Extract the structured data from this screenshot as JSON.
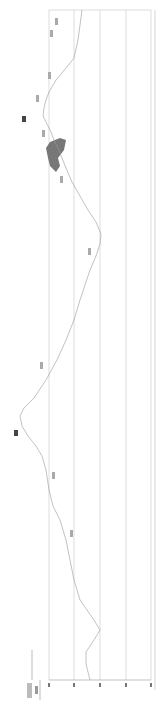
{
  "chart_data": {
    "type": "line",
    "orientation": "rotated-90",
    "title": "",
    "xlabel": "",
    "ylabel": "m",
    "grid": true,
    "plot_box": {
      "left": 49,
      "right": 151,
      "top": 10,
      "bottom": 680
    },
    "gridlines_x": [
      49,
      74,
      100,
      126,
      151
    ],
    "tick_labels": [
      "",
      "",
      "",
      "",
      ""
    ],
    "curve_points": [
      [
        82,
        10
      ],
      [
        78,
        40
      ],
      [
        74,
        58
      ],
      [
        66,
        68
      ],
      [
        56,
        80
      ],
      [
        49,
        92
      ],
      [
        46,
        100
      ],
      [
        44,
        108
      ],
      [
        43,
        116
      ],
      [
        47,
        124
      ],
      [
        51,
        132
      ],
      [
        54,
        140
      ],
      [
        58,
        148
      ],
      [
        62,
        158
      ],
      [
        66,
        168
      ],
      [
        72,
        182
      ],
      [
        80,
        196
      ],
      [
        88,
        210
      ],
      [
        96,
        222
      ],
      [
        101,
        234
      ],
      [
        100,
        244
      ],
      [
        96,
        256
      ],
      [
        90,
        270
      ],
      [
        84,
        288
      ],
      [
        80,
        300
      ],
      [
        74,
        320
      ],
      [
        66,
        340
      ],
      [
        58,
        358
      ],
      [
        46,
        380
      ],
      [
        34,
        398
      ],
      [
        24,
        408
      ],
      [
        20,
        416
      ],
      [
        22,
        426
      ],
      [
        28,
        436
      ],
      [
        36,
        446
      ],
      [
        42,
        456
      ],
      [
        46,
        470
      ],
      [
        49,
        490
      ],
      [
        53,
        506
      ],
      [
        60,
        520
      ],
      [
        66,
        540
      ],
      [
        70,
        560
      ],
      [
        74,
        580
      ],
      [
        80,
        600
      ],
      [
        94,
        620
      ],
      [
        100,
        630
      ],
      [
        94,
        640
      ],
      [
        86,
        652
      ],
      [
        86,
        664
      ],
      [
        90,
        680
      ]
    ],
    "annotations": [
      {
        "x": 55,
        "y": 18,
        "text": "",
        "bold": false
      },
      {
        "x": 50,
        "y": 30,
        "text": "",
        "bold": false
      },
      {
        "x": 48,
        "y": 72,
        "text": "",
        "bold": false
      },
      {
        "x": 36,
        "y": 95,
        "text": "",
        "bold": false
      },
      {
        "x": 22,
        "y": 116,
        "text": "",
        "bold": true
      },
      {
        "x": 42,
        "y": 130,
        "text": "",
        "bold": false
      },
      {
        "x": 60,
        "y": 176,
        "text": "",
        "bold": false
      },
      {
        "x": 88,
        "y": 248,
        "text": "",
        "bold": false
      },
      {
        "x": 40,
        "y": 362,
        "text": "",
        "bold": false
      },
      {
        "x": 14,
        "y": 430,
        "text": "",
        "bold": true
      },
      {
        "x": 52,
        "y": 472,
        "text": "",
        "bold": false
      },
      {
        "x": 70,
        "y": 530,
        "text": "",
        "bold": false
      }
    ],
    "filled_shape_color": "#777777",
    "line_color": "#999999",
    "grid_color": "#bbbbbb"
  }
}
